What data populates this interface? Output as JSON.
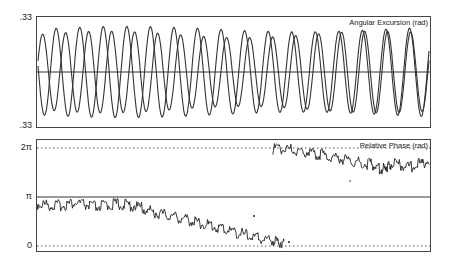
{
  "chart_data": [
    {
      "type": "line",
      "title": "Angular Excursion (rad)",
      "xlabel": "",
      "ylabel": "",
      "yticks": [
        ".33",
        ".33"
      ],
      "ylim": [
        -0.33,
        0.33
      ],
      "grid": false,
      "reference_line": 0,
      "series": [
        {
          "name": "oscillator-1",
          "description": "sinusoid, ~17 cycles, amplitude ~0.28 rad"
        },
        {
          "name": "oscillator-2",
          "description": "sinusoid, ~17 cycles, amplitude ~0.30 rad, phase-shifted relative to oscillator-1"
        }
      ],
      "cycles": 17
    },
    {
      "type": "line",
      "title": "Relative Phase (rad)",
      "xlabel": "",
      "ylabel": "",
      "yticks": [
        "0",
        "π",
        "2π"
      ],
      "ylim": [
        0,
        6.283
      ],
      "grid": "dotted at 0 and 2π, solid at π",
      "series": [
        {
          "name": "relative-phase",
          "x_frac": [
            0.0,
            0.05,
            0.1,
            0.15,
            0.2,
            0.25,
            0.3,
            0.35,
            0.4,
            0.45,
            0.5,
            0.55,
            0.6,
            0.63
          ],
          "y_over_pi": [
            0.86,
            0.82,
            0.88,
            0.8,
            0.86,
            0.82,
            0.68,
            0.6,
            0.5,
            0.4,
            0.3,
            0.18,
            0.12,
            0.06
          ]
        },
        {
          "name": "relative-phase-wrapped",
          "x_frac": [
            0.6,
            0.65,
            0.7,
            0.75,
            0.8,
            0.85,
            0.88,
            0.9,
            0.95,
            1.0
          ],
          "y_over_pi": [
            1.98,
            1.96,
            1.9,
            1.82,
            1.74,
            1.66,
            1.56,
            1.68,
            1.62,
            1.74
          ]
        }
      ]
    }
  ],
  "top_panel": {
    "title": "Angular Excursion (rad)",
    "y_top": ".33",
    "y_bottom": ".33"
  },
  "bottom_panel": {
    "title": "Relative Phase (rad)",
    "y_top": "2π",
    "y_mid": "π",
    "y_bottom": "0"
  }
}
